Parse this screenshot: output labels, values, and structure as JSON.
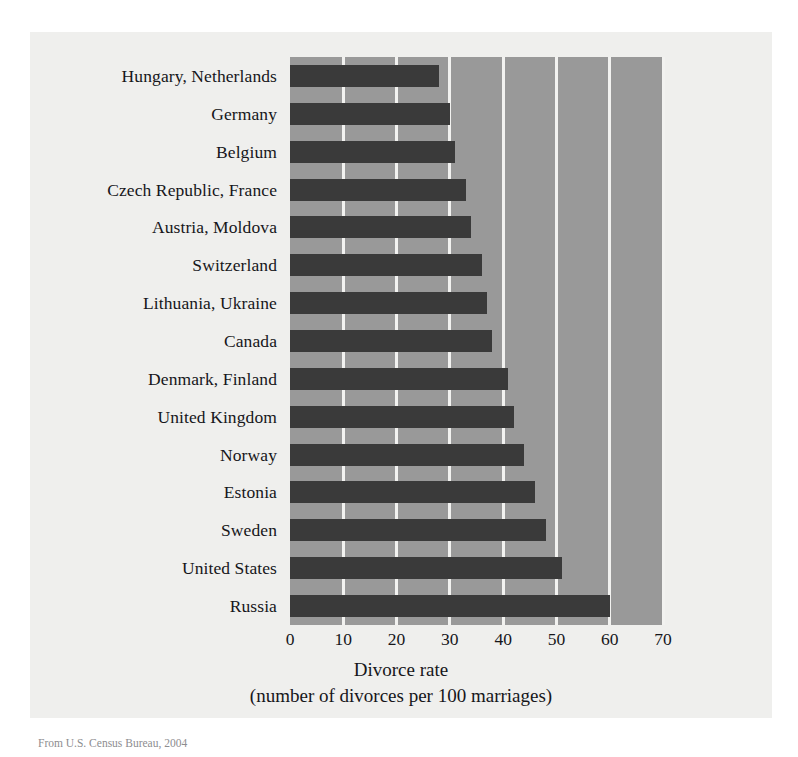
{
  "figure": {
    "source_caption": "From U.S. Census Bureau, 2004",
    "panel_background": "#efefed",
    "plot_background": "#999999",
    "bar_color": "#3a3a3a",
    "gridline_color": "#f2f2f0"
  },
  "chart_data": {
    "type": "bar",
    "orientation": "horizontal",
    "title": "",
    "xlabel": "Divorce rate",
    "xlabel_line2": "(number of divorces per 100 marriages)",
    "ylabel": "",
    "xlim": [
      0,
      70
    ],
    "xticks": [
      0,
      10,
      20,
      30,
      40,
      50,
      60,
      70
    ],
    "xtick_labels": [
      "0",
      "10",
      "20",
      "30",
      "40",
      "50",
      "60",
      "70"
    ],
    "grid": true,
    "grid_axis": "x",
    "legend": false,
    "categories": [
      "Hungary, Netherlands",
      "Germany",
      "Belgium",
      "Czech Republic, France",
      "Austria, Moldova",
      "Switzerland",
      "Lithuania, Ukraine",
      "Canada",
      "Denmark, Finland",
      "United Kingdom",
      "Norway",
      "Estonia",
      "Sweden",
      "United States",
      "Russia"
    ],
    "values": [
      28,
      30,
      31,
      33,
      34,
      36,
      37,
      38,
      41,
      42,
      44,
      46,
      48,
      51,
      60
    ],
    "units": "divorces per 100 marriages"
  }
}
